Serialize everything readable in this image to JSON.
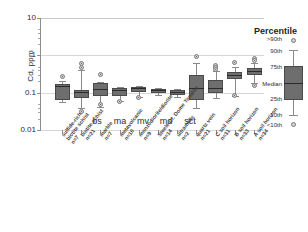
{
  "chart_data": {
    "type": "box",
    "title": "",
    "xlabel": "",
    "ylabel": "Cd, ppm",
    "yscale": "log",
    "ylim": [
      0.01,
      10
    ],
    "ytick_labels": [
      "10",
      "1",
      "0.1",
      "0.01"
    ],
    "ytick_values": [
      10,
      1,
      0.1,
      0.01
    ],
    "grid": true,
    "legend_position": "right",
    "inner_labels": [
      "bs",
      "ma",
      "mv",
      "md",
      "sct"
    ],
    "categories": [
      "sulfide-rich biotite schist",
      "biotite schist",
      "marble",
      "metavolcanic",
      "monzodiorite/diorite",
      "Steele Cr. Dome Tonalite",
      "ultramafic",
      "quartz vein",
      "C soil horizon",
      "B soil horizon",
      "A soil horizon"
    ],
    "sample_counts": [
      "n=7",
      "n=21",
      "n=7",
      "n=10",
      "n=9",
      "n=14",
      "n=2",
      "n=21",
      "n=31",
      "n=33",
      "n=34"
    ],
    "boxes": [
      {
        "category": "sulfide-rich biotite schist",
        "n": 7,
        "p10": 0.055,
        "p25": 0.062,
        "median": 0.155,
        "p75": 0.175,
        "p90": 0.2,
        "outliers_high": [
          0.27
        ],
        "outliers_low": []
      },
      {
        "category": "biotite schist",
        "n": 21,
        "p10": 0.04,
        "p25": 0.072,
        "median": 0.105,
        "p75": 0.115,
        "p90": 0.4,
        "outliers_high": [
          0.6,
          0.47
        ],
        "outliers_low": [
          0.031
        ]
      },
      {
        "category": "marble",
        "n": 7,
        "p10": 0.042,
        "p25": 0.082,
        "median": 0.125,
        "p75": 0.18,
        "p90": 0.195,
        "outliers_high": [
          0.31
        ],
        "outliers_low": [
          0.047
        ]
      },
      {
        "category": "metavolcanic",
        "n": 10,
        "p10": 0.06,
        "p25": 0.08,
        "median": 0.118,
        "p75": 0.132,
        "p90": 0.14,
        "outliers_high": [],
        "outliers_low": [
          0.058
        ]
      },
      {
        "category": "monzodiorite/diorite",
        "n": 9,
        "p10": 0.075,
        "p25": 0.105,
        "median": 0.13,
        "p75": 0.138,
        "p90": 0.15,
        "outliers_high": [],
        "outliers_low": [
          0.072
        ]
      },
      {
        "category": "Steele Cr. Dome Tonalite",
        "n": 14,
        "p10": 0.085,
        "p25": 0.095,
        "median": 0.118,
        "p75": 0.128,
        "p90": 0.135,
        "outliers_high": [],
        "outliers_low": []
      },
      {
        "category": "ultramafic",
        "n": 2,
        "p10": 0.078,
        "p25": 0.088,
        "median": 0.105,
        "p75": 0.118,
        "p90": 0.128,
        "outliers_high": [],
        "outliers_low": []
      },
      {
        "category": "quartz vein",
        "n": 21,
        "p10": 0.038,
        "p25": 0.062,
        "median": 0.135,
        "p75": 0.29,
        "p90": 0.62,
        "outliers_high": [
          0.95
        ],
        "outliers_low": []
      },
      {
        "category": "C soil horizon",
        "n": 31,
        "p10": 0.072,
        "p25": 0.1,
        "median": 0.135,
        "p75": 0.215,
        "p90": 0.38,
        "outliers_high": [
          0.55,
          0.46,
          0.42
        ],
        "outliers_low": []
      },
      {
        "category": "B soil horizon",
        "n": 33,
        "p10": 0.082,
        "p25": 0.23,
        "median": 0.29,
        "p75": 0.36,
        "p90": 0.5,
        "outliers_high": [
          0.63
        ],
        "outliers_low": [
          0.083
        ]
      },
      {
        "category": "A soil horizon",
        "n": 34,
        "p10": 0.185,
        "p25": 0.3,
        "median": 0.37,
        "p75": 0.47,
        "p90": 0.62,
        "outliers_high": [
          0.8,
          0.73
        ],
        "outliers_low": [
          0.155
        ]
      }
    ]
  },
  "axis": {
    "y_title": "Cd, ppm",
    "y_ticks": [
      {
        "label": "10"
      },
      {
        "label": "1"
      },
      {
        "label": "0.1"
      },
      {
        "label": "0.01"
      }
    ]
  },
  "inner": {
    "l0": "bs",
    "l1": "ma",
    "l2": "mv",
    "l3": "md",
    "l4": "sct"
  },
  "legend": {
    "title": "Percentile",
    "items": [
      {
        "label": ">90th"
      },
      {
        "label": "90th"
      },
      {
        "label": "75th"
      },
      {
        "label": "Median"
      },
      {
        "label": "25th"
      },
      {
        "label": "10th"
      },
      {
        "label": "<10th"
      }
    ]
  },
  "cat_labels": [
    {
      "name": "sulfide-rich",
      "line2": "biotite schist",
      "n": "n=7"
    },
    {
      "name": "biotite schist",
      "line2": "",
      "n": "n=21"
    },
    {
      "name": "marble",
      "line2": "",
      "n": "n=7"
    },
    {
      "name": "metavolcanic",
      "line2": "",
      "n": "n=10"
    },
    {
      "name": "monzodiorite/diorite",
      "line2": "",
      "n": "n=9"
    },
    {
      "name": "Steele Cr. Dome Tonalite",
      "line2": "",
      "n": "n=14"
    },
    {
      "name": "ultramafic",
      "line2": "",
      "n": "n=2"
    },
    {
      "name": "quartz vein",
      "line2": "",
      "n": "n=21"
    },
    {
      "name": "C soil horizon",
      "line2": "",
      "n": "n=31"
    },
    {
      "name": "B soil horizon",
      "line2": "",
      "n": "n=33"
    },
    {
      "name": "A soil horizon",
      "line2": "",
      "n": "n=34"
    }
  ],
  "colors": {
    "box_fill": "#6e6e6e",
    "box_edge": "#4a4a4a",
    "median": "#2b2b2b",
    "whisker": "#8a8a8a",
    "outlier_fill": "#d2d2d2",
    "grid": "#d8d8d8",
    "axis": "#8d8d8d",
    "text": "#2c2c2c"
  }
}
